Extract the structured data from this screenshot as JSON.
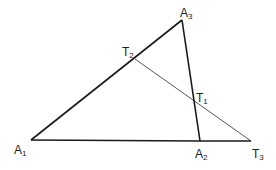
{
  "diagram": {
    "type": "geometry",
    "colors": {
      "background": "#ffffff",
      "triangle_stroke": "#1a1a1a",
      "transversal_stroke": "#444444",
      "label": "#222222"
    },
    "points": {
      "A1": {
        "x": 31,
        "y": 140,
        "label_main": "A",
        "label_sub": "1"
      },
      "A2": {
        "x": 200,
        "y": 141,
        "label_main": "A",
        "label_sub": "2"
      },
      "A3": {
        "x": 182,
        "y": 20,
        "label_main": "A",
        "label_sub": "3"
      },
      "T1": {
        "x": 194,
        "y": 100,
        "label_main": "T",
        "label_sub": "1"
      },
      "T2": {
        "x": 135,
        "y": 59,
        "label_main": "T",
        "label_sub": "2"
      },
      "T3": {
        "x": 251,
        "y": 141,
        "label_main": "T",
        "label_sub": "3"
      }
    },
    "segments": [
      {
        "from": "A1",
        "to": "A2",
        "style": "thick"
      },
      {
        "from": "A2",
        "to": "T3",
        "style": "thick"
      },
      {
        "from": "A1",
        "to": "A3",
        "style": "thick"
      },
      {
        "from": "A3",
        "to": "A2",
        "style": "thick"
      },
      {
        "from": "T2",
        "to": "T3",
        "style": "thin"
      }
    ]
  }
}
